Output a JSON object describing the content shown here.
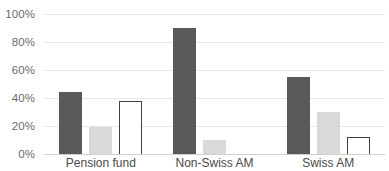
{
  "chart_data": {
    "type": "bar",
    "title": "",
    "subtitle": "",
    "xlabel": "",
    "ylabel": "",
    "categories": [
      "Pension fund",
      "Non-Swiss AM",
      "Swiss AM"
    ],
    "series": [
      {
        "name": "Series 1",
        "color": "#595959",
        "style": "filled-dark",
        "values": [
          44,
          90,
          55
        ]
      },
      {
        "name": "Series 2",
        "color": "#d9d9d9",
        "style": "filled-light",
        "values": [
          19,
          10,
          30
        ]
      },
      {
        "name": "Series 3",
        "color": "#ffffff",
        "style": "outline",
        "values": [
          38,
          0,
          12
        ]
      }
    ],
    "ylim": [
      0,
      100
    ],
    "y_ticks": [
      0,
      20,
      40,
      60,
      80,
      100
    ],
    "y_tick_labels": [
      "0%",
      "20%",
      "40%",
      "60%",
      "80%",
      "100%"
    ],
    "grid": true,
    "grid_axis": "y",
    "legend": false,
    "legend_position": "none",
    "value_format": "percent"
  },
  "axis": {
    "y": {
      "tick_0": "0%",
      "tick_1": "20%",
      "tick_2": "40%",
      "tick_3": "60%",
      "tick_4": "80%",
      "tick_5": "100%"
    },
    "x": {
      "cat_0": "Pension fund",
      "cat_1": "Non-Swiss AM",
      "cat_2": "Swiss AM"
    }
  },
  "colors": {
    "series_dark": "#595959",
    "series_light": "#d9d9d9",
    "series_outline_stroke": "#404040",
    "gridline": "#e8e8e8",
    "axis_text": "#6a6a6a",
    "category_text": "#4a4a4a",
    "background": "#ffffff"
  }
}
